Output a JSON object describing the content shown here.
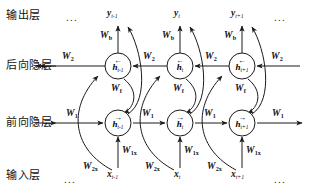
{
  "figure": {
    "type": "bidirectional-rnn-unfolded-diagram",
    "background": "#ffffff",
    "stroke": "#1a1a1a"
  },
  "row_labels": {
    "output": "输出层",
    "backward_hidden": "后向隐层",
    "forward_hidden": "前向隐层",
    "input": "输入层"
  },
  "ellipses": {
    "top_left": "...",
    "top_right": "...",
    "bottom_left": "...",
    "bottom_right": "..."
  },
  "outputs": [
    {
      "base": "y",
      "sub": "t-1"
    },
    {
      "base": "y",
      "sub": "t"
    },
    {
      "base": "y",
      "sub": "t+1"
    }
  ],
  "inputs": [
    {
      "base": "x",
      "sub": "t-1"
    },
    {
      "base": "x",
      "sub": "t"
    },
    {
      "base": "x",
      "sub": "t+1"
    }
  ],
  "backward_nodes": [
    {
      "base": "h",
      "sub": "t-1",
      "arrow": "←"
    },
    {
      "base": "h",
      "sub": "t",
      "arrow": "←"
    },
    {
      "base": "h",
      "sub": "t+1",
      "arrow": "←"
    }
  ],
  "forward_nodes": [
    {
      "base": "h",
      "sub": "t-1",
      "arrow": "→"
    },
    {
      "base": "h",
      "sub": "t",
      "arrow": "→"
    },
    {
      "base": "h",
      "sub": "t+1",
      "arrow": "→"
    }
  ],
  "weights": {
    "output_bias": {
      "base": "W",
      "sub": "b"
    },
    "backward_recurrent": {
      "base": "W",
      "sub": "2"
    },
    "forward_recurrent": {
      "base": "W",
      "sub": "1"
    },
    "cross": {
      "base": "W",
      "sub": "f"
    },
    "input_forward": {
      "base": "W",
      "sub": "1x"
    },
    "input_backward": {
      "base": "W",
      "sub": "2x"
    }
  },
  "weight_labels": {
    "w_b": "W_b",
    "w_1": "W_1",
    "w_2": "W_2",
    "w_f": "W_f",
    "w_1x": "W_1x",
    "w_2x": "W_2x"
  },
  "geometry": {
    "columns_x": [
      118,
      180,
      242
    ],
    "backward_row_y": 66,
    "forward_row_y": 123,
    "output_row_y": 16,
    "input_row_y": 176,
    "node_radius": 13
  }
}
